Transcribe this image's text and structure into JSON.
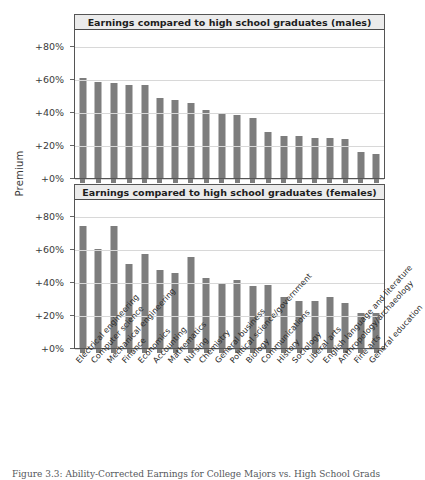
{
  "axis_title": "Premium",
  "caption": "Figure 3.3: Ability-Corrected Earnings for College Majors vs. High School Grads",
  "panels": [
    {
      "key": "males",
      "title": "Earnings compared to high school graduates (males)"
    },
    {
      "key": "females",
      "title": "Earnings compared to high school graduates (females)"
    }
  ],
  "yticks": [
    "+80%",
    "+60%",
    "+40%",
    "+20%",
    "+0%"
  ],
  "chart_data": {
    "type": "bar",
    "title": "Ability-Corrected Earnings for College Majors vs. High School Grads",
    "xlabel": "",
    "ylabel": "Premium",
    "ylim": [
      0,
      90
    ],
    "ytick_values": [
      80,
      60,
      40,
      20,
      0
    ],
    "ytick_labels": [
      "+80%",
      "+60%",
      "+40%",
      "+20%",
      "+0%"
    ],
    "grid": true,
    "legend": "none",
    "categories": [
      "Electrical engineering",
      "Computer science",
      "Mechanical engineering",
      "Finance",
      "Economics",
      "Accounting",
      "Mathematics",
      "Nursing",
      "Chemistry",
      "General business",
      "Political science/government",
      "Biology",
      "Communications",
      "History",
      "Sociology",
      "Liberal arts",
      "English language and literature",
      "Anthropology/archaeology",
      "Fine arts",
      "General education"
    ],
    "series": [
      {
        "name": "Earnings compared to high school graduates (males)",
        "unit": "percent",
        "values": [
          61,
          58.5,
          57.5,
          56.5,
          56.5,
          48.5,
          47.5,
          45.5,
          41.5,
          39.5,
          38.5,
          36.5,
          28,
          25.5,
          25.5,
          24.5,
          24.5,
          23.5,
          16,
          14.5
        ]
      },
      {
        "name": "Earnings compared to high school graduates (females)",
        "unit": "percent",
        "values": [
          74,
          60.5,
          74,
          51,
          57,
          47.5,
          45.5,
          55.5,
          42.5,
          39.5,
          41.5,
          37.5,
          38.5,
          31,
          28.5,
          28.5,
          31,
          27.5,
          21,
          21.5
        ]
      }
    ]
  }
}
